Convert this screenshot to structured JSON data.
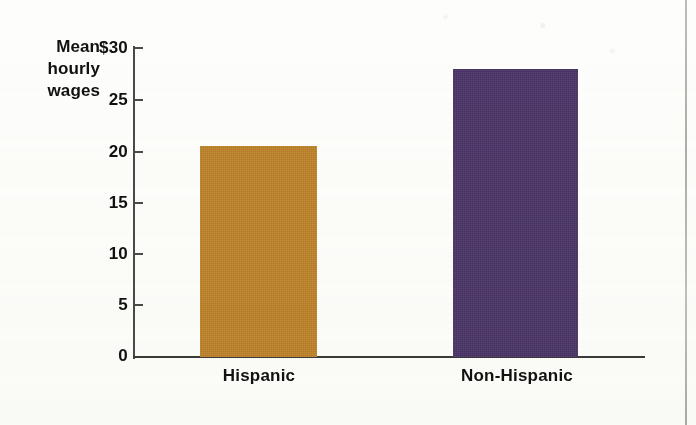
{
  "chart_data": {
    "type": "bar",
    "title": "",
    "subtitle": "",
    "xlabel": "",
    "ylabel": "Mean hourly wages",
    "ylabel_lines": [
      "Mean",
      "hourly",
      "wages"
    ],
    "categories": [
      "Hispanic",
      "Non-Hispanic"
    ],
    "values": [
      20.5,
      28.0
    ],
    "ylim": [
      0,
      30
    ],
    "y_ticks": [
      0,
      5,
      10,
      15,
      20,
      25,
      30
    ],
    "y_tick_labels": [
      "0",
      "5",
      "10",
      "15",
      "20",
      "25",
      "$30"
    ],
    "currency_symbol": "$",
    "grid": false,
    "legend": false,
    "legend_position": "none",
    "bar_colors": [
      "#c08428",
      "#4a3468"
    ],
    "series": [
      {
        "name": "Mean hourly wages",
        "points": [
          {
            "category": "Hispanic",
            "value": 20.5,
            "color": "#c08428"
          },
          {
            "category": "Non-Hispanic",
            "value": 28.0,
            "color": "#4a3468"
          }
        ]
      }
    ]
  },
  "axis": {
    "y_title_lines": [
      "Mean",
      "hourly",
      "wages"
    ],
    "ticks": [
      {
        "label": "$30",
        "value": 30
      },
      {
        "label": "25",
        "value": 25
      },
      {
        "label": "20",
        "value": 20
      },
      {
        "label": "15",
        "value": 15
      },
      {
        "label": "10",
        "value": 10
      },
      {
        "label": "5",
        "value": 5
      },
      {
        "label": "0",
        "value": 0
      }
    ]
  },
  "colors": {
    "bar_hispanic": "#c08428",
    "bar_non_hispanic": "#4a3468",
    "axis": "#3a3a3a",
    "text": "#111111",
    "page_background": "#fdfdfb",
    "page_edge_rule": "#b0b1ab"
  }
}
